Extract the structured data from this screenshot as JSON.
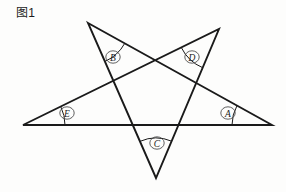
{
  "figure": {
    "caption": "图1",
    "background_color": "#fdfdfc",
    "stroke_color": "#1a1a1a"
  },
  "chart_data": {
    "type": "diagram",
    "title": "图1",
    "shape": "pentagram",
    "xlim": [
      0,
      286
    ],
    "ylim": [
      0,
      192
    ],
    "grid": false,
    "legend": null,
    "vertices": [
      {
        "id": "B",
        "label": "B",
        "role": "upper-left-point",
        "x": 88,
        "y": 23
      },
      {
        "id": "D",
        "label": "D",
        "role": "upper-right-point",
        "x": 219,
        "y": 29
      },
      {
        "id": "A",
        "label": "A",
        "role": "right-point",
        "x": 272,
        "y": 125
      },
      {
        "id": "C",
        "label": "C",
        "role": "bottom-point",
        "x": 156,
        "y": 178
      },
      {
        "id": "E",
        "label": "E",
        "role": "left-point",
        "x": 23,
        "y": 125
      }
    ],
    "path_order": [
      "B",
      "A",
      "E",
      "D",
      "C",
      "B"
    ],
    "edges": [
      {
        "from": "B",
        "to": "A"
      },
      {
        "from": "A",
        "to": "E"
      },
      {
        "from": "E",
        "to": "D"
      },
      {
        "from": "D",
        "to": "C"
      },
      {
        "from": "C",
        "to": "B"
      }
    ],
    "angle_marks": [
      {
        "id": "B",
        "label": "B",
        "vertex_x": 88,
        "vertex_y": 23,
        "arc_radius": 42,
        "label_x": 113,
        "label_y": 57
      },
      {
        "id": "D",
        "label": "D",
        "vertex_x": 219,
        "vertex_y": 29,
        "arc_radius": 42,
        "label_x": 192,
        "label_y": 57
      },
      {
        "id": "A",
        "label": "A",
        "vertex_x": 272,
        "vertex_y": 125,
        "arc_radius": 40,
        "label_x": 228,
        "label_y": 113
      },
      {
        "id": "C",
        "label": "C",
        "vertex_x": 156,
        "vertex_y": 178,
        "arc_radius": 40,
        "label_x": 157,
        "label_y": 143
      },
      {
        "id": "E",
        "label": "E",
        "vertex_x": 23,
        "vertex_y": 125,
        "arc_radius": 42,
        "label_x": 67,
        "label_y": 113
      }
    ]
  }
}
